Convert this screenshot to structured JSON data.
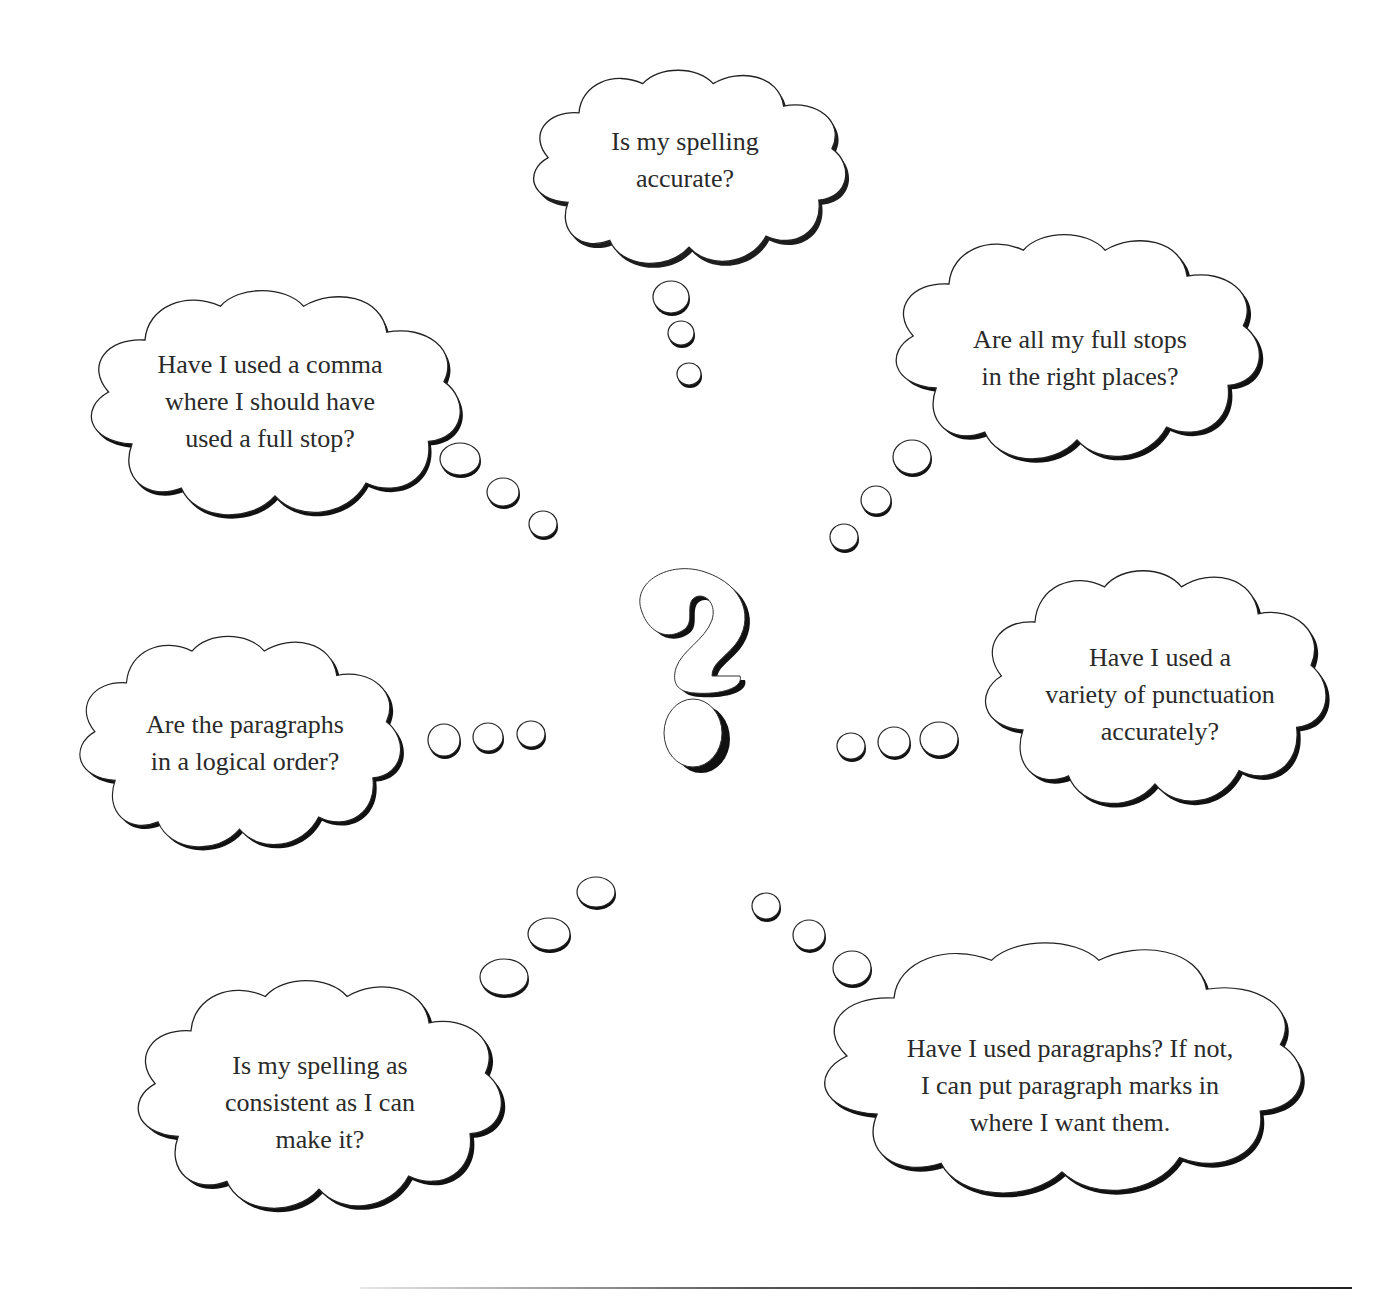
{
  "diagram": {
    "center_symbol": "?",
    "center_icon": "question-mark-icon",
    "thought_bubbles": [
      {
        "id": "spelling-accurate",
        "lines": [
          "Is my spelling",
          "accurate?"
        ],
        "position": "top-center",
        "trail_direction": "down"
      },
      {
        "id": "comma-full-stop",
        "lines": [
          "Have I used a comma",
          "where I should have",
          "used a full stop?"
        ],
        "position": "upper-left",
        "trail_direction": "down-right"
      },
      {
        "id": "full-stops-places",
        "lines": [
          "Are all my full stops",
          "in the right places?"
        ],
        "position": "upper-right",
        "trail_direction": "down-left"
      },
      {
        "id": "paragraphs-order",
        "lines": [
          "Are the paragraphs",
          "in a logical order?"
        ],
        "position": "middle-left",
        "trail_direction": "right"
      },
      {
        "id": "punctuation-variety",
        "lines": [
          "Have I used a",
          "variety of punctuation",
          "accurately?"
        ],
        "position": "middle-right",
        "trail_direction": "left"
      },
      {
        "id": "spelling-consistent",
        "lines": [
          "Is my spelling as",
          "consistent as I can",
          "make it?"
        ],
        "position": "lower-left",
        "trail_direction": "up-right"
      },
      {
        "id": "paragraphs-used",
        "lines": [
          "Have I used paragraphs? If not,",
          "I can put paragraph marks in",
          "where I want them."
        ],
        "position": "lower-right",
        "trail_direction": "up-left"
      }
    ]
  },
  "colors": {
    "outline": "#222222",
    "fill": "#ffffff",
    "shadow": "#111111",
    "text": "#2a2a2a"
  }
}
